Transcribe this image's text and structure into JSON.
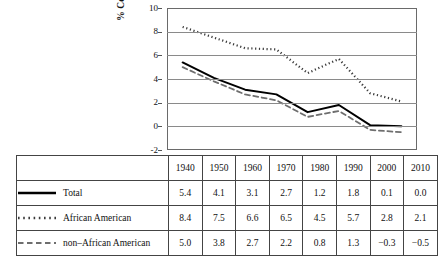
{
  "chart_data": {
    "type": "line",
    "title": "",
    "xlabel": "",
    "ylabel": "% Census Undercount",
    "ylim": [
      -2,
      10
    ],
    "yticks": [
      10,
      8,
      6,
      4,
      2,
      0,
      -2
    ],
    "ytick_labels": [
      "10",
      "8",
      "6",
      "4",
      "2",
      "0",
      "-2"
    ],
    "grid": true,
    "legend_position": "table-below",
    "categories": [
      "1940",
      "1950",
      "1960",
      "1970",
      "1980",
      "1990",
      "2000",
      "2010"
    ],
    "series": [
      {
        "name": "Total",
        "style": "solid",
        "color": "#000000",
        "values": [
          5.4,
          4.1,
          3.1,
          2.7,
          1.2,
          1.8,
          0.1,
          0.0
        ],
        "value_labels": [
          "5.4",
          "4.1",
          "3.1",
          "2.7",
          "1.2",
          "1.8",
          "0.1",
          "0.0"
        ]
      },
      {
        "name": "African American",
        "style": "dotted",
        "color": "#3a3a3a",
        "values": [
          8.4,
          7.5,
          6.6,
          6.5,
          4.5,
          5.7,
          2.8,
          2.1
        ],
        "value_labels": [
          "8.4",
          "7.5",
          "6.6",
          "6.5",
          "4.5",
          "5.7",
          "2.8",
          "2.1"
        ]
      },
      {
        "name": "non–African American",
        "style": "dashed",
        "color": "#6e6e6e",
        "values": [
          5.0,
          3.8,
          2.7,
          2.2,
          0.8,
          1.3,
          -0.3,
          -0.5
        ],
        "value_labels": [
          "5.0",
          "3.8",
          "2.7",
          "2.2",
          "0.8",
          "1.3",
          "−0.3",
          "−0.5"
        ]
      }
    ]
  },
  "table": {
    "column_headers": [
      "1940",
      "1950",
      "1960",
      "1970",
      "1980",
      "1990",
      "2000",
      "2010"
    ],
    "rows": [
      {
        "label": "Total",
        "swatch": "solid-line-swatch",
        "values": [
          "5.4",
          "4.1",
          "3.1",
          "2.7",
          "1.2",
          "1.8",
          "0.1",
          "0.0"
        ]
      },
      {
        "label": "African American",
        "swatch": "dotted-line-swatch",
        "values": [
          "8.4",
          "7.5",
          "6.6",
          "6.5",
          "4.5",
          "5.7",
          "2.8",
          "2.1"
        ]
      },
      {
        "label": "non–African American",
        "swatch": "dashed-line-swatch",
        "values": [
          "5.0",
          "3.8",
          "2.7",
          "2.2",
          "0.8",
          "1.3",
          "−0.3",
          "−0.5"
        ]
      }
    ]
  },
  "colors": {
    "total_line": "#000000",
    "african_american_line": "#3a3a3a",
    "non_african_american_line": "#6e6e6e",
    "gridline": "#8a8a8a",
    "frame": "#6a6a6a",
    "table_border": "#444444",
    "background": "#ffffff"
  }
}
